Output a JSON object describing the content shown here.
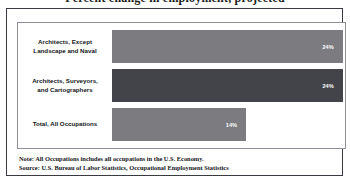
{
  "chart_data": {
    "type": "bar",
    "orientation": "horizontal",
    "title": "Percent change in employment, projected",
    "categories": [
      "Architects, Except Landscape and Naval",
      "Architects, Surveyors, and Cartographers",
      "Total, All Occupations"
    ],
    "values": [
      24,
      24,
      14
    ],
    "data_labels": [
      "24%",
      "24%",
      "14%"
    ],
    "xlabel": "",
    "ylabel": "",
    "xlim": [
      0,
      26
    ],
    "grid": false,
    "legend": false,
    "bar_colors": [
      "#7b7b80",
      "#43434a",
      "#7b7b80"
    ],
    "label_color": "#ffffff"
  },
  "bars": [
    {
      "label_line1": "Architects, Except",
      "label_line2": "Landscape and Naval",
      "value_text": "24%",
      "width_pct": 99,
      "color": "#7b7b80"
    },
    {
      "label_line1": "Architects, Surveyors,",
      "label_line2": "and Cartographers",
      "value_text": "24%",
      "width_pct": 99,
      "color": "#43434a"
    },
    {
      "label_line1": "Total, All Occupations",
      "label_line2": "",
      "value_text": "14%",
      "width_pct": 57.5,
      "color": "#7b7b80"
    }
  ],
  "notes": {
    "note": "Note: All Occupations includes all occupations in the U.S. Economy.",
    "source": "Source: U.S. Bureau of Labor Statistics, Occupational Employment Statistics"
  }
}
